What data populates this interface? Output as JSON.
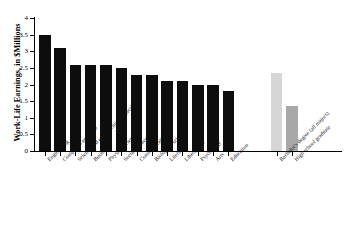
{
  "chart_data": {
    "type": "bar",
    "title": "",
    "xlabel": "",
    "ylabel": "Work-Life Earnings, in $Millions",
    "ylim": [
      0,
      4
    ],
    "ytick_labels": [
      "0",
      "0.5",
      "1",
      "1.5",
      "2",
      "2.5",
      "3",
      "3.5",
      "4"
    ],
    "ytick_values": [
      0,
      0.5,
      1,
      1.5,
      2,
      2.5,
      3,
      3.5,
      4
    ],
    "grid": false,
    "legend": "none",
    "categories": [
      "Engineering",
      "Computers and math",
      "Science and engineering technical",
      "Business",
      "Physical science",
      "Social science",
      "Communications",
      "Biological sciences",
      "Literature",
      "Liberal arts",
      "Psychology",
      "Arts",
      "Education",
      "Bachelor's degree (all majors)",
      "High school graduate"
    ],
    "values": [
      3.5,
      3.11,
      2.59,
      2.59,
      2.59,
      2.49,
      2.29,
      2.28,
      2.1,
      2.1,
      1.99,
      1.99,
      1.81,
      2.35,
      1.35
    ],
    "bar_colors": [
      "#0d0d0d",
      "#0d0d0d",
      "#0d0d0d",
      "#0d0d0d",
      "#0d0d0d",
      "#0d0d0d",
      "#0d0d0d",
      "#0d0d0d",
      "#0d0d0d",
      "#0d0d0d",
      "#0d0d0d",
      "#0d0d0d",
      "#0d0d0d",
      "#d6d6d6",
      "#a8a8a8"
    ],
    "groups": [
      {
        "name": "majors",
        "count": 13,
        "color": "#0d0d0d"
      },
      {
        "name": "reference",
        "count": 2,
        "colors": [
          "#d6d6d6",
          "#a8a8a8"
        ]
      }
    ]
  },
  "axis": {
    "y_title": "Work-Life Earnings, in $Millions"
  }
}
